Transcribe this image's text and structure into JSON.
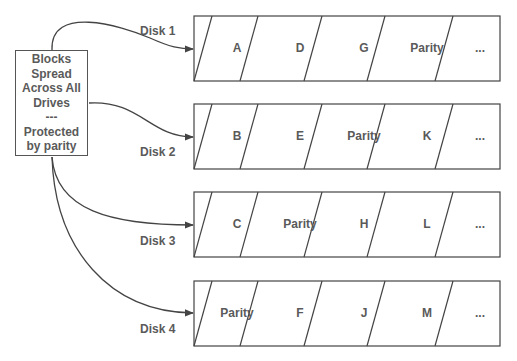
{
  "source": {
    "lines": [
      "Blocks",
      "Spread",
      "Across All",
      "Drives",
      "---",
      "Protected",
      "by parity"
    ]
  },
  "disks": [
    {
      "label": "Disk 1",
      "blocks": [
        "A",
        "D",
        "G",
        "Parity",
        "..."
      ]
    },
    {
      "label": "Disk 2",
      "blocks": [
        "B",
        "E",
        "Parity",
        "K",
        "..."
      ]
    },
    {
      "label": "Disk 3",
      "blocks": [
        "C",
        "Parity",
        "H",
        "L",
        "..."
      ]
    },
    {
      "label": "Disk 4",
      "blocks": [
        "Parity",
        "F",
        "J",
        "M",
        "..."
      ]
    }
  ],
  "colors": {
    "stroke": "#555555",
    "text": "#5a5a5a",
    "background": "#ffffff"
  }
}
